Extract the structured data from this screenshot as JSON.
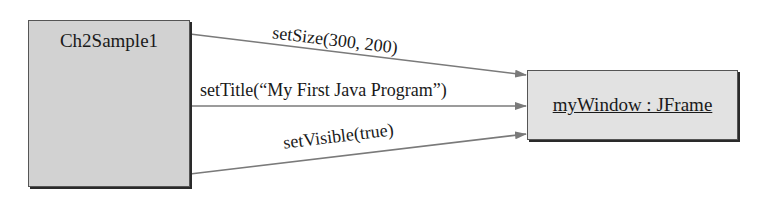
{
  "diagram": {
    "sender": {
      "name": "Ch2Sample1"
    },
    "receiver": {
      "name": "myWindow : JFrame"
    },
    "messages": [
      {
        "label": "setSize(300, 200)"
      },
      {
        "label": "setTitle(“My First Java Program”)"
      },
      {
        "label": "setVisible(true)"
      }
    ],
    "colors": {
      "box_fill": "#d2d2d2",
      "receiver_fill": "#e2e2e2",
      "arrow": "#7a7a7a",
      "shadow": "#2a2a2a"
    }
  }
}
